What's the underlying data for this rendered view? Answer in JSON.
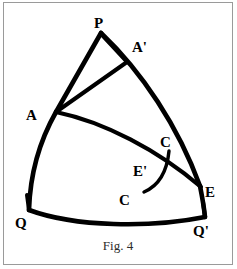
{
  "figure": {
    "caption": "Fig. 4",
    "background_color": "#ffffff",
    "ink_color": "#000000",
    "border_color": "#9a9a9a",
    "labels": {
      "p": "P",
      "a_prime": "A'",
      "a": "A",
      "c_upper": "C",
      "e_prime": "E'",
      "c_lower": "C",
      "e": "E",
      "q": "Q",
      "q_prime": "Q'"
    },
    "label_positions": {
      "p": {
        "x": 98,
        "y": 23
      },
      "a_prime": {
        "x": 135,
        "y": 50
      },
      "a": {
        "x": 29,
        "y": 120
      },
      "c_upper": {
        "x": 162,
        "y": 143
      },
      "e_prime": {
        "x": 138,
        "y": 173
      },
      "c_lower": {
        "x": 122,
        "y": 203
      },
      "e": {
        "x": 205,
        "y": 197
      },
      "q": {
        "x": 16,
        "y": 226
      },
      "q_prime": {
        "x": 196,
        "y": 234
      }
    },
    "vertices": {
      "P": {
        "x": 101,
        "y": 33
      },
      "A_prime": {
        "x": 126,
        "y": 61
      },
      "A": {
        "x": 55,
        "y": 113
      },
      "E": {
        "x": 202,
        "y": 186
      },
      "E_prime": {
        "x": 166,
        "y": 166
      },
      "C_upper": {
        "x": 168,
        "y": 152
      },
      "C_lower": {
        "x": 144,
        "y": 192
      },
      "Q": {
        "x": 29,
        "y": 210
      },
      "Q_prime": {
        "x": 205,
        "y": 217
      }
    },
    "strokes": [
      {
        "name": "arc-p-a-q",
        "path": "M 101 33 L 55 113"
      },
      {
        "name": "arc-a-q",
        "path": "M 55 113 Q 29 160 29 210"
      },
      {
        "name": "arc-p-e",
        "path": "M 101 33 Q 165 100 202 186"
      },
      {
        "name": "arc-q-qprime",
        "path": "M 29 210 Q 117 238 205 217"
      },
      {
        "name": "line-a-aprime",
        "path": "M 55 113 L 126 61"
      },
      {
        "name": "line-p-aprime",
        "path": "M 101 33 L 126 61"
      },
      {
        "name": "arc-a-e",
        "path": "M 55 113 Q 135 138 202 186"
      },
      {
        "name": "arc-c-c",
        "path": "M 168 152 Q 160 180 144 192"
      },
      {
        "name": "tick-q",
        "path": "M 27 196 L 29 210"
      },
      {
        "name": "tick-qprime",
        "path": "M 203 203 L 205 217"
      }
    ]
  }
}
